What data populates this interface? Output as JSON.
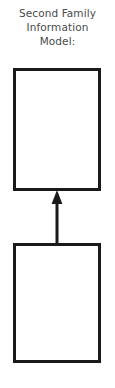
{
  "diagram": {
    "heading": {
      "line1": "Second Family",
      "line2": "Information",
      "line3": "Model:"
    },
    "nodes": [
      {
        "id": "upper-box",
        "label": "",
        "shape": "rectangle",
        "empty": true
      },
      {
        "id": "lower-box",
        "label": "",
        "shape": "rectangle",
        "empty": true
      }
    ],
    "connectors": [
      {
        "id": "lower-to-upper",
        "type": "arrow",
        "direction": "up",
        "from": "lower-box",
        "to": "upper-box",
        "label": ""
      }
    ],
    "colors": {
      "background": "#ffffff",
      "stroke": "#1a1a1a",
      "text": "#4a4a4a"
    }
  }
}
